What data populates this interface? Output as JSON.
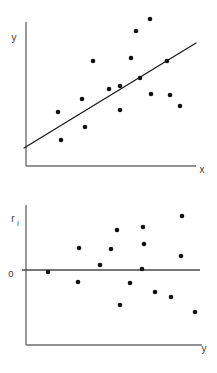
{
  "figure": {
    "title": "",
    "background_color": "#ffffff",
    "point_color": "#111111",
    "line_color": "#1a1a1a",
    "axis_color": "#6e6e6e",
    "panel_count": 2
  },
  "panels": {
    "scatter": {
      "name": "scatter-with-regression-line",
      "y_axis_label": "y",
      "x_axis_label": "x",
      "geometry": {
        "axis_x": 26,
        "axis_top": 22,
        "axis_bottom": 166,
        "axis_right": 196,
        "y_label_x": 14,
        "y_label_y": 38,
        "x_label_x": 202,
        "x_label_y": 170
      }
    },
    "residual": {
      "name": "residual-plot",
      "y_axis_label": "r",
      "y_axis_label_subscript": "i",
      "x_axis_label": "y",
      "zero_tick_label": "0",
      "geometry": {
        "axis_x": 26,
        "axis_top": 205,
        "axis_bottom": 345,
        "axis_right": 200,
        "zero_y": 270,
        "y_label_x": 13,
        "y_label_y": 219,
        "x_label_x": 204,
        "x_label_y": 349,
        "zero_label_x": 11,
        "zero_label_y": 274
      }
    }
  },
  "chart_data": [
    {
      "type": "scatter",
      "name": "scatter-with-regression-line",
      "title": "",
      "xlabel": "x",
      "ylabel": "y",
      "xlim": [
        0,
        10
      ],
      "ylim": [
        0,
        10
      ],
      "grid": false,
      "legend": "none",
      "annotations": [
        "fitted least-squares regression line"
      ],
      "points_px": [
        [
          61,
          140
        ],
        [
          58,
          112
        ],
        [
          85,
          127
        ],
        [
          82,
          99
        ],
        [
          93,
          61
        ],
        [
          109,
          89
        ],
        [
          120,
          110
        ],
        [
          131,
          58
        ],
        [
          136,
          31
        ],
        [
          140,
          78
        ],
        [
          150,
          19
        ],
        [
          151,
          94
        ],
        [
          167,
          61
        ],
        [
          170,
          95
        ],
        [
          180,
          106
        ],
        [
          120,
          86
        ]
      ],
      "points_data": [
        {
          "x": 2.05,
          "y": 1.81
        },
        {
          "x": 1.88,
          "y": 3.76
        },
        {
          "x": 3.47,
          "y": 2.71
        },
        {
          "x": 3.29,
          "y": 4.67
        },
        {
          "x": 3.94,
          "y": 7.32
        },
        {
          "x": 4.88,
          "y": 5.36
        },
        {
          "x": 5.53,
          "y": 3.9
        },
        {
          "x": 6.18,
          "y": 7.53
        },
        {
          "x": 6.47,
          "y": 9.41
        },
        {
          "x": 6.71,
          "y": 6.13
        },
        {
          "x": 7.29,
          "y": 10.24
        },
        {
          "x": 7.35,
          "y": 5.02
        },
        {
          "x": 8.29,
          "y": 7.32
        },
        {
          "x": 8.47,
          "y": 4.95
        },
        {
          "x": 9.06,
          "y": 4.18
        },
        {
          "x": 5.53,
          "y": 5.57
        }
      ],
      "series": [
        {
          "name": "regression-line",
          "type": "line",
          "x": [
            1.94,
            11.0
          ],
          "y": [
            1.25,
            8.58
          ],
          "endpoints_px": [
            [
              24,
              148
            ],
            [
              196,
              43
            ]
          ],
          "slope": 0.61,
          "intercept": 0.0
        }
      ]
    },
    {
      "type": "scatter",
      "name": "residual-plot",
      "title": "",
      "xlabel": "y",
      "ylabel": "r_i",
      "xlim": [
        0,
        10
      ],
      "ylim": [
        -5,
        5
      ],
      "grid": false,
      "legend": "none",
      "annotations": [
        "horizontal reference line at r = 0"
      ],
      "points_px": [
        [
          48,
          272
        ],
        [
          78,
          282
        ],
        [
          79,
          248
        ],
        [
          111,
          249
        ],
        [
          117,
          230
        ],
        [
          120,
          305
        ],
        [
          142,
          269
        ],
        [
          143,
          227
        ],
        [
          144,
          244
        ],
        [
          155,
          292
        ],
        [
          171,
          297
        ],
        [
          181,
          256
        ],
        [
          182,
          216
        ],
        [
          195,
          312
        ],
        [
          130,
          283
        ],
        [
          100,
          265
        ]
      ],
      "points_data": [
        {
          "x": 1.26,
          "r": -0.07
        },
        {
          "x": 2.98,
          "r": -0.43
        },
        {
          "x": 3.05,
          "r": 0.79
        },
        {
          "x": 4.89,
          "r": 0.75
        },
        {
          "x": 5.23,
          "r": 1.43
        },
        {
          "x": 5.4,
          "r": -1.25
        },
        {
          "x": 6.67,
          "r": 0.04
        },
        {
          "x": 6.72,
          "r": 1.54
        },
        {
          "x": 6.78,
          "r": 0.93
        },
        {
          "x": 7.41,
          "r": -0.79
        },
        {
          "x": 8.33,
          "r": -0.96
        },
        {
          "x": 8.91,
          "r": 0.5
        },
        {
          "x": 8.97,
          "r": 1.93
        },
        {
          "x": 9.71,
          "r": -1.5
        },
        {
          "x": 5.98,
          "r": -0.46
        },
        {
          "x": 4.25,
          "r": 0.18
        }
      ],
      "series": [
        {
          "name": "zero-reference-line",
          "type": "line",
          "x": [
            0,
            10
          ],
          "y": [
            0,
            0
          ],
          "endpoints_px": [
            [
              26,
              270
            ],
            [
              200,
              270
            ]
          ]
        }
      ]
    }
  ]
}
